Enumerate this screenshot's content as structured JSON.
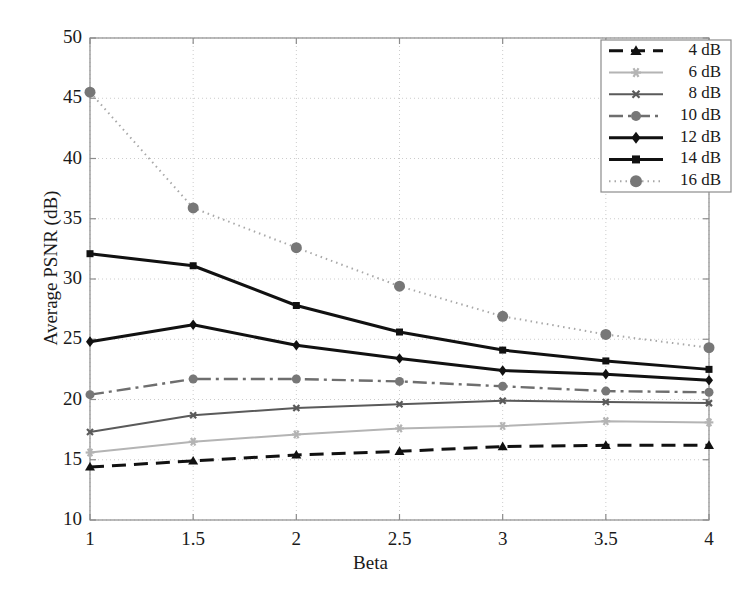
{
  "chart_data": {
    "type": "line",
    "title": "",
    "xlabel": "Beta",
    "ylabel": "Average PSNR (dB)",
    "x": [
      1,
      1.5,
      2,
      2.5,
      3,
      3.5,
      4
    ],
    "xtick_labels": [
      "1",
      "1.5",
      "2",
      "2.5",
      "3",
      "3.5",
      "4"
    ],
    "ytick_labels": [
      "10",
      "15",
      "20",
      "25",
      "30",
      "35",
      "40",
      "45",
      "50"
    ],
    "yticks": [
      10,
      15,
      20,
      25,
      30,
      35,
      40,
      45,
      50
    ],
    "xlim": [
      1,
      4
    ],
    "ylim": [
      10,
      50
    ],
    "grid": true,
    "legend_position": "upper right",
    "series": [
      {
        "name": "4 dB",
        "values": [
          14.4,
          14.9,
          15.4,
          15.7,
          16.1,
          16.2,
          16.2
        ],
        "color": "#111111",
        "dash": "14,8",
        "width": 3.0,
        "marker": "triangle",
        "marker_size": 8,
        "marker_color": "#111111"
      },
      {
        "name": "6 dB",
        "values": [
          15.6,
          16.5,
          17.1,
          17.6,
          17.8,
          18.2,
          18.1
        ],
        "color": "#b4b4b4",
        "dash": "none",
        "width": 2.0,
        "marker": "star",
        "marker_size": 7,
        "marker_color": "#b4b4b4"
      },
      {
        "name": "8 dB",
        "values": [
          17.3,
          18.7,
          19.3,
          19.6,
          19.9,
          19.8,
          19.7
        ],
        "color": "#5a5a5a",
        "dash": "none",
        "width": 2.0,
        "marker": "cross",
        "marker_size": 6,
        "marker_color": "#5a5a5a"
      },
      {
        "name": "10 dB",
        "values": [
          20.4,
          21.7,
          21.7,
          21.5,
          21.1,
          20.7,
          20.6
        ],
        "color": "#6e6e6e",
        "dash": "14,5,3,5",
        "width": 2.4,
        "marker": "circle",
        "marker_size": 7,
        "marker_color": "#777777"
      },
      {
        "name": "12 dB",
        "values": [
          24.8,
          26.2,
          24.5,
          23.4,
          22.4,
          22.1,
          21.6
        ],
        "color": "#111111",
        "dash": "none",
        "width": 3.0,
        "marker": "diamond",
        "marker_size": 8,
        "marker_color": "#111111"
      },
      {
        "name": "14 dB",
        "values": [
          32.1,
          31.1,
          27.8,
          25.6,
          24.1,
          23.2,
          22.5
        ],
        "color": "#111111",
        "dash": "none",
        "width": 3.0,
        "marker": "square",
        "marker_size": 7,
        "marker_color": "#111111"
      },
      {
        "name": "16 dB",
        "values": [
          45.5,
          35.9,
          32.6,
          29.4,
          26.9,
          25.4,
          24.3
        ],
        "color": "#a8a8a8",
        "dash": "1.5,4",
        "width": 2.0,
        "marker": "circle",
        "marker_size": 9,
        "marker_color": "#777777"
      }
    ]
  },
  "legend": {
    "entries": [
      "4 dB",
      "6 dB",
      "8 dB",
      "10 dB",
      "12 dB",
      "14 dB",
      "16 dB"
    ]
  },
  "colors": {
    "axis": "#8c8c8c",
    "grid": "#cccccc",
    "text": "#1a1a1a",
    "background": "#ffffff"
  }
}
